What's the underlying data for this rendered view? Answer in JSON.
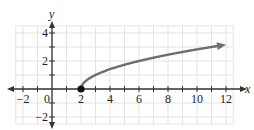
{
  "chart_data": {
    "type": "line",
    "title": "",
    "xlabel": "x",
    "ylabel": "y",
    "xlim": [
      -2.5,
      12.5
    ],
    "ylim": [
      -2.5,
      4.5
    ],
    "grid": true,
    "x_ticks": [
      -2,
      0,
      2,
      4,
      6,
      8,
      10,
      12
    ],
    "y_ticks": [
      -2,
      2,
      4
    ],
    "x_tick_labels": [
      "−2",
      "0",
      "2",
      "4",
      "6",
      "8",
      "10",
      "12"
    ],
    "y_tick_labels": [
      "−2",
      "2",
      "4"
    ],
    "series": [
      {
        "name": "y = sqrt(x - 2)",
        "x": [
          2,
          2.25,
          2.5,
          3,
          4,
          5,
          6,
          7,
          8,
          9,
          10,
          11,
          12
        ],
        "y": [
          0,
          0.5,
          0.71,
          1,
          1.41,
          1.73,
          2,
          2.24,
          2.45,
          2.65,
          2.83,
          3,
          3.16
        ],
        "color": "#6e6e6e",
        "start_point": {
          "x": 2,
          "y": 0,
          "filled": true,
          "color": "#111111"
        },
        "end_arrow": true
      }
    ]
  },
  "colors": {
    "grid": "#e3e3e3",
    "axis": "#333333",
    "curve": "#6e6e6e",
    "point": "#111111"
  }
}
